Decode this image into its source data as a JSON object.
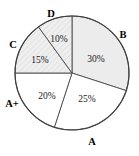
{
  "chart_data": {
    "type": "pie",
    "title": "",
    "categories": [
      "B",
      "A",
      "A+",
      "C",
      "D"
    ],
    "values": [
      30,
      25,
      20,
      15,
      10
    ],
    "value_labels": [
      "30%",
      "25%",
      "20%",
      "15%",
      "10%"
    ],
    "slices": [
      {
        "label": "B",
        "value": 30,
        "value_label": "30%",
        "start_angle": 0,
        "end_angle": 108,
        "fill": "#ececec",
        "hatched": false,
        "label_x": 123,
        "label_y": 36,
        "pct_x": 96,
        "pct_y": 60
      },
      {
        "label": "A",
        "value": 25,
        "value_label": "25%",
        "start_angle": 108,
        "end_angle": 198,
        "fill": "#ffffff",
        "hatched": false,
        "label_x": 92,
        "label_y": 143,
        "pct_x": 87,
        "pct_y": 100
      },
      {
        "label": "A+",
        "value": 20,
        "value_label": "20%",
        "start_angle": 198,
        "end_angle": 270,
        "fill": "#ffffff",
        "hatched": false,
        "label_x": 12,
        "label_y": 105,
        "pct_x": 47,
        "pct_y": 97
      },
      {
        "label": "C",
        "value": 15,
        "value_label": "15%",
        "start_angle": 270,
        "end_angle": 324,
        "fill": "#ebebeb",
        "hatched": true,
        "label_x": 13,
        "label_y": 46,
        "pct_x": 40,
        "pct_y": 61
      },
      {
        "label": "D",
        "value": 10,
        "value_label": "10%",
        "start_angle": 324,
        "end_angle": 360,
        "fill": "#ebebeb",
        "hatched": true,
        "label_x": 51,
        "label_y": 15,
        "pct_x": 59,
        "pct_y": 40
      }
    ],
    "geometry": {
      "center_x": 72,
      "center_y": 73,
      "radius": 57
    },
    "legend": "inline-labels",
    "grid": false
  },
  "accent_colors": {
    "slice_gray": "#ececec",
    "slice_white": "#ffffff",
    "outline": "#3d3d3d",
    "divider": "#4a4a4a",
    "text": "#000000",
    "background": "#ffffff"
  }
}
